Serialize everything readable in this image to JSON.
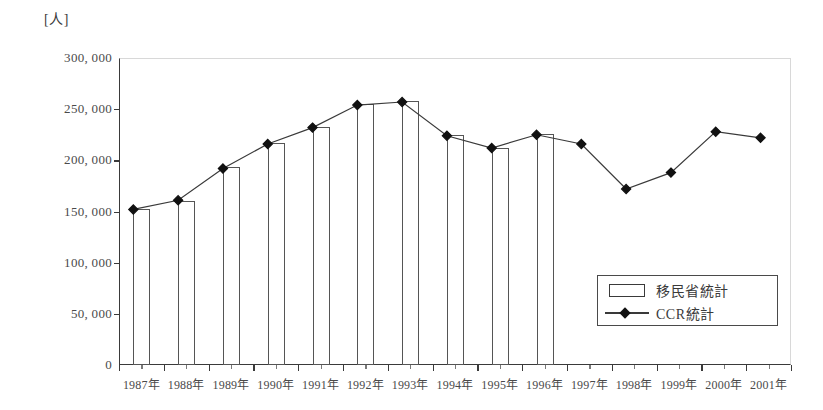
{
  "chart_data": {
    "type": "bar",
    "title": "",
    "subtitle": "",
    "unit_label": "[人]",
    "xlabel": "",
    "ylabel": "",
    "ylim": [
      0,
      300000
    ],
    "y_ticks": [
      "0",
      "50, 000",
      "100, 000",
      "150, 000",
      "200, 000",
      "250, 000",
      "300, 000"
    ],
    "y_tick_values": [
      0,
      50000,
      100000,
      150000,
      200000,
      250000,
      300000
    ],
    "grid": false,
    "legend_position": "inside-bottom-right",
    "categories": [
      "1987年",
      "1988年",
      "1989年",
      "1990年",
      "1991年",
      "1992年",
      "1993年",
      "1994年",
      "1995年",
      "1996年",
      "1997年",
      "1998年",
      "1999年",
      "2000年",
      "2001年"
    ],
    "series": [
      {
        "name": "移民省統計",
        "type": "bar",
        "values": [
          152000,
          160000,
          193000,
          217000,
          233000,
          255000,
          258000,
          225000,
          212000,
          226000,
          null,
          null,
          null,
          null,
          null
        ]
      },
      {
        "name": "CCR統計",
        "type": "line",
        "marker": "diamond",
        "values": [
          152000,
          161000,
          192000,
          216000,
          232000,
          254000,
          257000,
          224000,
          212000,
          225000,
          216000,
          172000,
          188000,
          228000,
          222000
        ]
      }
    ]
  },
  "legend": {
    "items": [
      {
        "label": "移民省統計",
        "key": "bar-swatch"
      },
      {
        "label": "CCR統計",
        "key": "line-diamond-swatch"
      }
    ]
  }
}
